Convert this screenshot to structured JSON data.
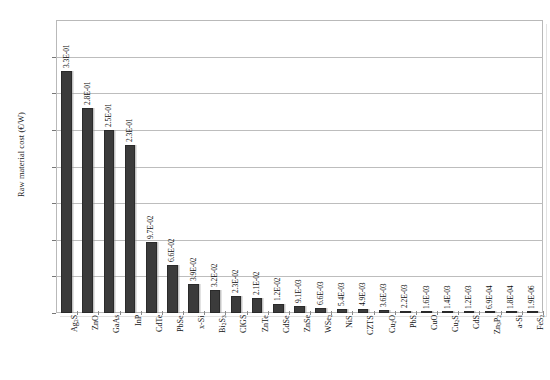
{
  "chart_data": {
    "type": "bar",
    "title": "",
    "xlabel": "",
    "ylabel": "Raw material cost (€/W)",
    "ylim": [
      0,
      0.4
    ],
    "grid": true,
    "legend": "none",
    "y_tick_labels": [
      "0.E+00",
      "5.E-02",
      "1.E-01",
      "2.E-01",
      "2.E-01",
      "3.E-01",
      "3.E-01",
      "4.E-01"
    ],
    "y_tick_values": [
      0,
      0.05,
      0.1,
      0.15,
      0.2,
      0.25,
      0.3,
      0.35,
      0.4
    ],
    "y_tick_labels_full": [
      "0.E+00",
      "5.E-02",
      "1.E-01",
      "2.E-01",
      "2.E-01",
      "3.E-01",
      "3.E-01",
      "4.E-01"
    ],
    "categories": [
      "Ag2S",
      "ZnO",
      "GaAs",
      "InP",
      "CdTe",
      "PbSe",
      "x-Si",
      "Bi2S3",
      "CIGS",
      "ZnTe",
      "CdSe",
      "ZnSe",
      "WSe2",
      "NiS",
      "CZTS",
      "Cu2O",
      "PbS",
      "CuO",
      "Cu2S",
      "CdS",
      "Zn3P2",
      "a-Si",
      "FeS2"
    ],
    "categories_display": [
      {
        "base": "Ag",
        "sub": "2",
        "tail": "S"
      },
      {
        "base": "ZnO",
        "sub": "",
        "tail": ""
      },
      {
        "base": "GaAs",
        "sub": "",
        "tail": ""
      },
      {
        "base": "InP",
        "sub": "",
        "tail": ""
      },
      {
        "base": "CdTe",
        "sub": "",
        "tail": ""
      },
      {
        "base": "PbSe",
        "sub": "",
        "tail": ""
      },
      {
        "base": "x-Si",
        "sub": "",
        "tail": ""
      },
      {
        "base": "Bi",
        "sub": "2",
        "tail": "S",
        "sub2": "3"
      },
      {
        "base": "CIGS",
        "sub": "",
        "tail": ""
      },
      {
        "base": "ZnTe",
        "sub": "",
        "tail": ""
      },
      {
        "base": "CdSe",
        "sub": "",
        "tail": ""
      },
      {
        "base": "ZnSe",
        "sub": "",
        "tail": ""
      },
      {
        "base": "WSe",
        "sub": "2",
        "tail": ""
      },
      {
        "base": "NiS",
        "sub": "",
        "tail": ""
      },
      {
        "base": "CZTS",
        "sub": "",
        "tail": ""
      },
      {
        "base": "Cu",
        "sub": "2",
        "tail": "O"
      },
      {
        "base": "PbS",
        "sub": "",
        "tail": ""
      },
      {
        "base": "CuO",
        "sub": "",
        "tail": ""
      },
      {
        "base": "Cu",
        "sub": "2",
        "tail": "S"
      },
      {
        "base": "CdS",
        "sub": "",
        "tail": ""
      },
      {
        "base": "Zn",
        "sub": "3",
        "tail": "P",
        "sub2": "2"
      },
      {
        "base": "a-Si",
        "sub": "",
        "tail": ""
      },
      {
        "base": "FeS",
        "sub": "2",
        "tail": ""
      }
    ],
    "values": [
      0.33,
      0.28,
      0.25,
      0.23,
      0.097,
      0.066,
      0.039,
      0.032,
      0.023,
      0.021,
      0.012,
      0.0091,
      0.0066,
      0.0054,
      0.0049,
      0.0036,
      0.0022,
      0.0016,
      0.0014,
      0.0012,
      0.00069,
      0.00018,
      1.9e-06
    ],
    "data_labels": [
      "3.3E-01",
      "2.8E-01",
      "2.5E-01",
      "2.3E-01",
      "9.7E-02",
      "6.6E-02",
      "3.9E-02",
      "3.2E-02",
      "2.3E-02",
      "2.1E-02",
      "1.2E-02",
      "9.1E-03",
      "6.6E-03",
      "5.4E-03",
      "4.9E-03",
      "3.6E-03",
      "2.2E-03",
      "1.6E-03",
      "1.4E-03",
      "1.2E-03",
      "6.9E-04",
      "1.8E-04",
      "1.9E-06"
    ],
    "bar_color": "#3b3b3b",
    "grid_color": "#bdbdbd",
    "plot_border_color": "#b9b9b9"
  }
}
